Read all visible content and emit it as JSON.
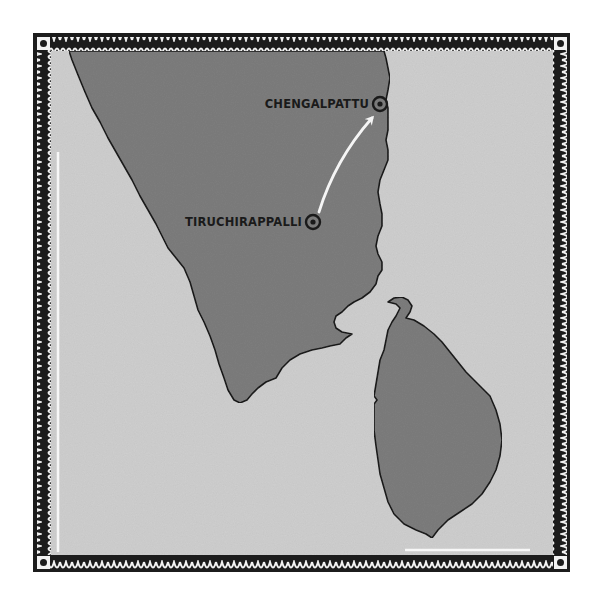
{
  "map": {
    "title": "",
    "colors": {
      "page_background": "#ffffff",
      "sea": "#cfcfcf",
      "land": "#7d7d7d",
      "coastline": "#1a1a1a",
      "border_dark": "#1c1c1c",
      "border_pattern": "#f2f2f2",
      "route_arrow": "#f5f5f5",
      "label_text": "#1a1a1a"
    },
    "landmasses": [
      {
        "name": "South India (mainland)"
      },
      {
        "name": "Sri Lanka"
      }
    ],
    "places": [
      {
        "name": "CHENGALPATTU",
        "marker": "circled-dot",
        "role": "destination"
      },
      {
        "name": "TIRUCHIRAPPALLI",
        "marker": "circled-dot",
        "role": "origin"
      }
    ],
    "route": {
      "from": "TIRUCHIRAPPALLI",
      "to": "CHENGALPATTU",
      "style": "white arrow"
    },
    "border": {
      "style": "decorative scalloped frame with corner dots"
    }
  }
}
